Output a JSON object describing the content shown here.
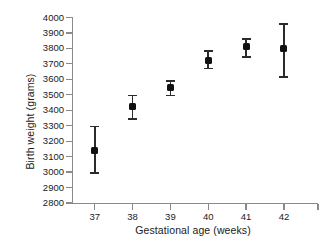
{
  "chart_data": {
    "type": "scatter",
    "title": "",
    "xlabel": "Gestational age (weeks)",
    "ylabel": "Birth weight (grams)",
    "categories": [
      37,
      38,
      39,
      40,
      41,
      42
    ],
    "x": [
      37,
      38,
      39,
      40,
      41,
      42
    ],
    "values": [
      3140,
      3425,
      3550,
      3725,
      3815,
      3800
    ],
    "error_low": [
      2990,
      3340,
      3490,
      3665,
      3740,
      3610
    ],
    "error_high": [
      3300,
      3500,
      3595,
      3790,
      3865,
      3965
    ],
    "xlim": [
      36.4,
      42.9
    ],
    "ylim": [
      2800,
      4000
    ],
    "xticks": [
      37,
      38,
      39,
      40,
      41,
      42
    ],
    "yticks": [
      2800,
      2900,
      3000,
      3100,
      3200,
      3300,
      3400,
      3500,
      3600,
      3700,
      3800,
      3900,
      4000
    ],
    "xtick_labels": [
      "37",
      "38",
      "39",
      "40",
      "41",
      "42"
    ],
    "ytick_labels": [
      "2800",
      "2900",
      "3000",
      "3100",
      "3200",
      "3300",
      "3400",
      "3500",
      "3600",
      "3700",
      "3800",
      "3900",
      "4000"
    ],
    "grid": false,
    "legend": null,
    "marker_color": "#111111",
    "errorbar_color": "#2b2b2b",
    "axis_color": "#8a8a8a",
    "background": "#ffffff",
    "series": [
      {
        "name": "Mean birth weight",
        "points": [
          {
            "x": 37,
            "y": 3140,
            "low": 2990,
            "high": 3300
          },
          {
            "x": 38,
            "y": 3425,
            "low": 3340,
            "high": 3500
          },
          {
            "x": 39,
            "y": 3550,
            "low": 3490,
            "high": 3595
          },
          {
            "x": 40,
            "y": 3725,
            "low": 3665,
            "high": 3790
          },
          {
            "x": 41,
            "y": 3815,
            "low": 3740,
            "high": 3865
          },
          {
            "x": 42,
            "y": 3800,
            "low": 3610,
            "high": 3965
          }
        ]
      }
    ]
  }
}
